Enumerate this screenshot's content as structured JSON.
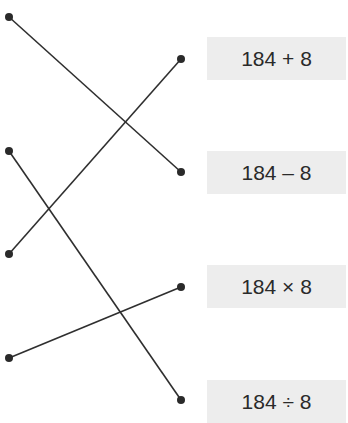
{
  "diagram": {
    "type": "matching",
    "line_color": "#2f2f2f",
    "dot_color": "#2a2a2a",
    "box_color": "#ededed",
    "left_dots": [
      {
        "x": 9,
        "y": 17
      },
      {
        "x": 9,
        "y": 151
      },
      {
        "x": 9,
        "y": 254
      },
      {
        "x": 9,
        "y": 358
      }
    ],
    "right_dots": [
      {
        "x": 181,
        "y": 59
      },
      {
        "x": 181,
        "y": 172
      },
      {
        "x": 181,
        "y": 287
      },
      {
        "x": 181,
        "y": 400
      }
    ],
    "connections": [
      {
        "from": 0,
        "to": 1
      },
      {
        "from": 1,
        "to": 3
      },
      {
        "from": 2,
        "to": 0
      },
      {
        "from": 3,
        "to": 2
      }
    ],
    "expressions": [
      {
        "label": "184 + 8",
        "top": 37
      },
      {
        "label": "184 – 8",
        "top": 151
      },
      {
        "label": "184 × 8",
        "top": 265
      },
      {
        "label": "184 ÷ 8",
        "top": 380
      }
    ]
  }
}
